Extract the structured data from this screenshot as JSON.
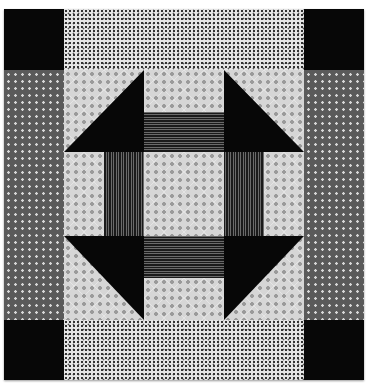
{
  "image": {
    "subject": "Churn Dash quilt block",
    "colors": {
      "black": "#070707",
      "light_print": "#d6d6d6",
      "speckle_print": "#e6e6e6",
      "dark_dot_print": "#5a5a5a",
      "wavy_stripe": "#1a1a1a"
    },
    "layout": {
      "corners": [
        "top-left black",
        "top-right black",
        "bottom-left black",
        "bottom-right black"
      ],
      "borders": [
        "top speckle",
        "bottom speckle",
        "left dark-dot",
        "right dark-dot"
      ],
      "center_block": "3x3 churn dash with half-square triangles and striped bars"
    }
  }
}
